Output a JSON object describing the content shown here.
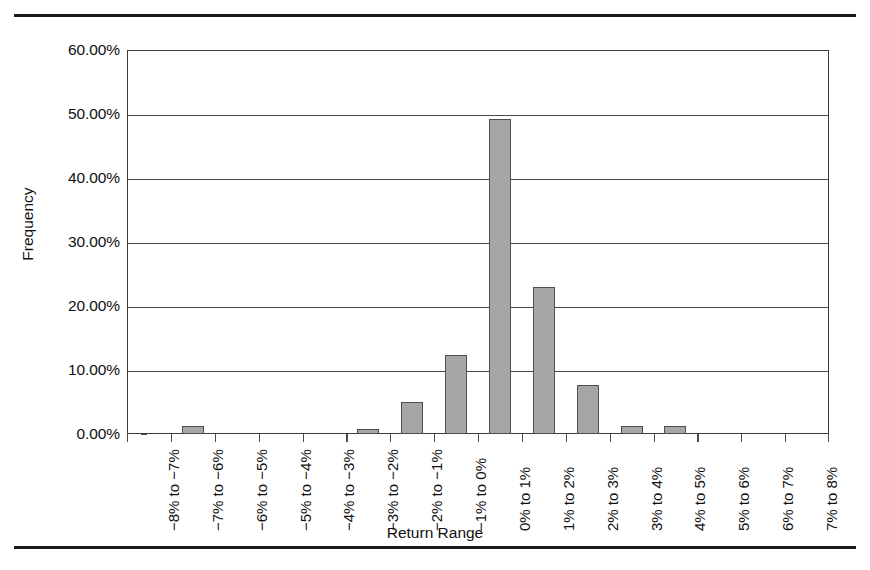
{
  "figure": {
    "top_rule": true,
    "bottom_rule": true
  },
  "chart_data": {
    "type": "bar",
    "title": "",
    "xlabel": "Return Range",
    "ylabel": "Frequency",
    "categories": [
      "−8% to −7%",
      "−7% to −6%",
      "−6% to −5%",
      "−5% to −4%",
      "−4% to −3%",
      "−3% to −2%",
      "−2% to −1%",
      "−1% to 0%",
      "0% to 1%",
      "1% to 2%",
      "2% to 3%",
      "3% to 4%",
      "4% to 5%",
      "5% to 6%",
      "6% to 7%",
      "7% to 8%"
    ],
    "values": [
      0,
      1.3,
      0,
      0,
      0,
      0.8,
      5.0,
      12.3,
      49.2,
      23.0,
      7.7,
      1.3,
      1.3,
      0,
      0,
      0
    ],
    "value_unit": "%",
    "ylim": [
      0,
      60
    ],
    "ytick_values": [
      0,
      10,
      20,
      30,
      40,
      50,
      60
    ],
    "ytick_labels": [
      "0.00%",
      "10.00%",
      "20.00%",
      "30.00%",
      "40.00%",
      "50.00%",
      "60.00%"
    ],
    "grid": "horizontal",
    "legend": "none",
    "bar_fill_color": "#a6a6a6",
    "bar_border_color": "#4f4f4f",
    "axis_color": "#3a3a3a",
    "gridline_color": "#4a4a4a",
    "background_color": "#ffffff"
  }
}
